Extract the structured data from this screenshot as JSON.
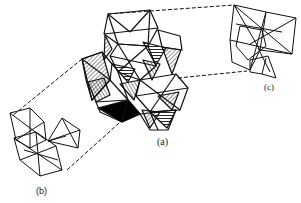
{
  "diagram": {
    "type": "crystal-structure-polyhedra",
    "labels": {
      "a": "(a)",
      "b": "(b)",
      "c": "(c)"
    },
    "parts": [
      {
        "id": "a",
        "description": "central cluster of linked octahedra with hatched and solid-black shaded faces"
      },
      {
        "id": "b",
        "description": "wireframe polyhedral sub-unit, bottom-left"
      },
      {
        "id": "c",
        "description": "wireframe polyhedral sub-unit, top-right"
      }
    ],
    "connectors": "dashed lines linking (a) to (b) and (a) to (c)",
    "colors": {
      "line": "#111111",
      "background": "#ffffff",
      "fill_solid": "#000000"
    }
  }
}
